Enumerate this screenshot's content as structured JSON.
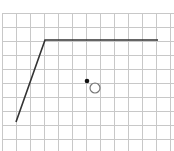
{
  "diagram": {
    "type": "grid-sketch",
    "grid": {
      "origin_x": 2,
      "origin_y": 13,
      "cell": 14,
      "cols": 12,
      "rows": 10,
      "color": "#c8c8c8"
    },
    "polyline": {
      "points": [
        [
          16,
          122
        ],
        [
          45,
          40
        ],
        [
          158,
          40
        ]
      ],
      "color": "#333333",
      "width": 1.6
    },
    "dot": {
      "cx": 87,
      "cy": 81,
      "r": 2.3,
      "color": "#111111"
    },
    "hollow_circle": {
      "cx": 95,
      "cy": 88,
      "r": 5,
      "stroke": "#777777"
    }
  }
}
